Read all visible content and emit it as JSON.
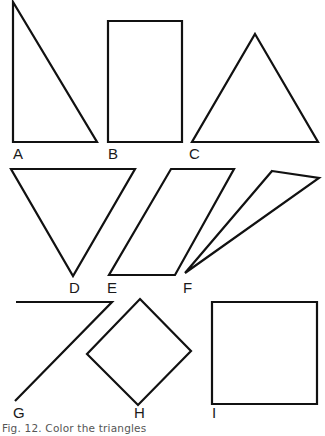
{
  "figure": {
    "caption": "Fig. 12. Color the triangles",
    "stroke_color": "#111111",
    "background": "#ffffff"
  },
  "shapes": [
    {
      "id": "A",
      "label": "A",
      "kind": "right-triangle",
      "points": "13,2 13,142 97,142",
      "is_triangle": true
    },
    {
      "id": "B",
      "label": "B",
      "kind": "rectangle",
      "points": "108,21 182,21 182,142 108,142",
      "is_triangle": false
    },
    {
      "id": "C",
      "label": "C",
      "kind": "triangle",
      "points": "255,34 318,142 192,142",
      "is_triangle": true
    },
    {
      "id": "D",
      "label": "D",
      "kind": "inverted-triangle",
      "points": "11,169 135,169 73,276",
      "is_triangle": true
    },
    {
      "id": "E",
      "label": "E",
      "kind": "parallelogram",
      "points": "171,169 234,169 175,275 109,275",
      "is_triangle": false
    },
    {
      "id": "F",
      "label": "F",
      "kind": "thin-triangle",
      "points": "272,171 319,178 185,273",
      "is_triangle": true
    },
    {
      "id": "G",
      "label": "G",
      "kind": "open-angle",
      "points": "16,302 112,302 15,401",
      "is_triangle": false
    },
    {
      "id": "H",
      "label": "H",
      "kind": "diamond",
      "points": "140,299 191,351 138,405 87,354",
      "is_triangle": false
    },
    {
      "id": "I",
      "label": "I",
      "kind": "square",
      "points": "212,302 317,302 317,404 212,404",
      "is_triangle": false
    }
  ],
  "labels": {
    "A": "A",
    "B": "B",
    "C": "C",
    "D": "D",
    "E": "E",
    "F": "F",
    "G": "G",
    "H": "H",
    "I": "I"
  }
}
